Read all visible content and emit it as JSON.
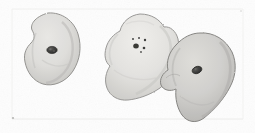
{
  "figure": {
    "title": "Pencil sketch of three amoeboid cells",
    "medium": "graphite pencil drawing on paper",
    "caption": "",
    "width_px": 255,
    "height_px": 133,
    "background_color": "#fdfdfd",
    "paper_color": "#f6f6f5",
    "frame": {
      "visible": true,
      "color": "#e8e8e6",
      "left_x": 12,
      "top_y": 9,
      "right_x": 243,
      "bottom_y": 119,
      "corner_mark_color": "#9a9a98"
    }
  },
  "specimens": [
    {
      "id": "cell-1",
      "label": "left cell",
      "shape": "rounded pear / kidney outline",
      "center": {
        "x": 52,
        "y": 49
      },
      "bounds": {
        "x": 24,
        "y": 13,
        "w": 56,
        "h": 72
      },
      "fill_color": "#dcdbd8",
      "outline_color": "#8d8c89",
      "shade_color": "#c8c7c3",
      "nucleus": {
        "count": 1,
        "type": "single dark nucleus",
        "center": {
          "x": 52,
          "y": 50
        },
        "rx": 5.2,
        "ry": 3.6,
        "color": "#3a3a38"
      },
      "granules": []
    },
    {
      "id": "cell-2",
      "label": "middle cell",
      "shape": "lobed amoeboid outline with pseudopodia",
      "center": {
        "x": 140,
        "y": 56
      },
      "bounds": {
        "x": 104,
        "y": 14,
        "w": 76,
        "h": 88
      },
      "fill_color": "#e2e1de",
      "outline_color": "#939290",
      "shade_color": "#cfcecb",
      "nucleus": {
        "count": 1,
        "type": "dark nucleus with surrounding granules",
        "center": {
          "x": 136,
          "y": 46
        },
        "rx": 2.8,
        "ry": 2.5,
        "color": "#2e2e2c"
      },
      "granules": [
        {
          "x": 133,
          "y": 39,
          "r": 1.0
        },
        {
          "x": 139,
          "y": 38,
          "r": 1.0
        },
        {
          "x": 145,
          "y": 40,
          "r": 1.2
        },
        {
          "x": 144,
          "y": 48,
          "r": 1.3
        },
        {
          "x": 141,
          "y": 52,
          "r": 0.9
        }
      ]
    },
    {
      "id": "cell-3",
      "label": "right cell",
      "shape": "tilted ovoid with lower-left lobe, overlaps middle cell",
      "center": {
        "x": 198,
        "y": 77
      },
      "bounds": {
        "x": 160,
        "y": 32,
        "w": 75,
        "h": 90
      },
      "fill_color": "#cfcecb",
      "outline_color": "#7f7e7b",
      "shade_color": "#bab9b6",
      "nucleus": {
        "count": 1,
        "type": "elongated dark nucleus",
        "center": {
          "x": 197,
          "y": 70
        },
        "rx": 5.0,
        "ry": 3.4,
        "color": "#2b2b29"
      },
      "granules": []
    }
  ],
  "annotations": {
    "visible_text": [],
    "scale_bar": null,
    "legend": null
  }
}
